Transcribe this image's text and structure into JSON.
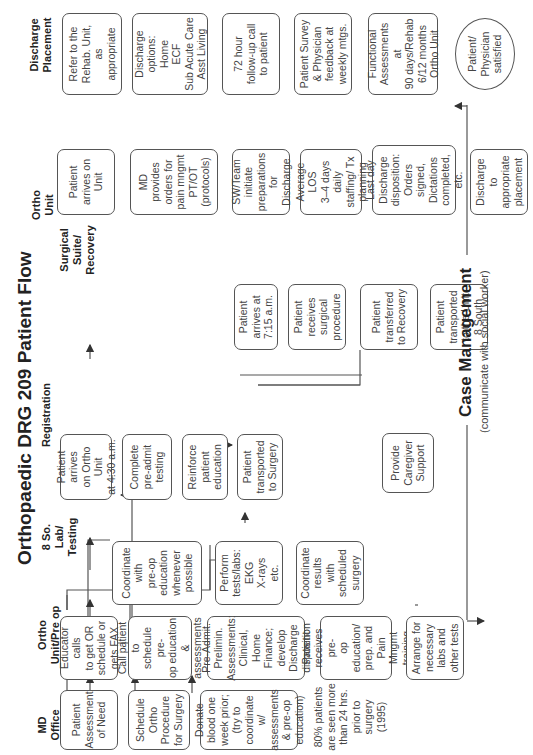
{
  "title": "Orthopaedic DRG 209  Patient Flow",
  "columns": [
    {
      "id": "md-office",
      "label": "MD\nOffice"
    },
    {
      "id": "ortho-preop",
      "label": "Ortho\nUnit/Pre op"
    },
    {
      "id": "lab-testing",
      "label": "8 So.\nLab/\nTesting"
    },
    {
      "id": "registration",
      "label": "Registration"
    },
    {
      "id": "surgical",
      "label": "Surgical\nSuite/\nRecovery"
    },
    {
      "id": "ortho-unit",
      "label": "Ortho\nUnit"
    },
    {
      "id": "discharge",
      "label": "Discharge\nPlacement"
    }
  ],
  "boxes": {
    "md_assessment": "Patient\nAssessment\nof Need",
    "md_schedule": "Schedule\nOrtho\nProcedure\nfor Surgery",
    "md_donate": "Donate\nblood one\nweek prior;\n(try to\ncoordinate w/\nassessments\n& pre-op\neducation)",
    "md_note": "80% patients\nare seen more\nthan 24 hrs.\nprior to\nsurgery\n(1995)",
    "pre_educator": "Educator calls\nto get OR\nschedule or\ngets FAX",
    "pre_call": "Call patient to\nschedule pre-\nop education\n&\nassessments",
    "pre_admit": "Pre-Admit.\nPrelimin.\nAssessments:\nClinical, Home\nFinance;\ndevelop\nDischarge\ndisposition",
    "pre_receives": "Patient\nreceives pre-\nop education/\nprep. and\nPain Mngmt\ntraining",
    "pre_arrange": "Arrange for\nnecessary\nlabs and\nother tests",
    "lab_coordinate": "Coordinate\nwith\npre-op\neducation\nwhenever\npossible",
    "lab_perform": "Perform\ntests/labs:\nEKG\nX-rays\netc.",
    "lab_results": "Coordinate\nresults\nwith\nscheduled\nsurgery",
    "reg_arrives": "Patient arrives\non Ortho Unit\nat 4:30 a.m.",
    "reg_complete": "Complete\npre-admit\ntesting",
    "reg_reinforce": "Reinforce\npatient\neducation",
    "reg_transported": "Patient\ntransported\nto Surgery",
    "reg_caregiver": "Provide\nCaregiver\nSupport",
    "surg_arrives": "Patient\narrives at\n7:15 a.m.",
    "surg_receives": "Patient\nreceives\nsurgical\nprocedure",
    "surg_recovery": "Patient\ntransferred\nto Recovery",
    "surg_unit": "Patient\ntransported\nto the Unit\n8 South",
    "ou_arrives": "Patient\narrives on\nUnit",
    "ou_md": "MD\nprovides\norders for\npain mngmt\nPT/OT\n(protocols)",
    "ou_sw": "SW/Team\ninitiate\npreparations\nfor Discharge",
    "ou_los": "Average LOS\n3–4 days daily\nstaffing/ Tx\nplanning",
    "ou_lastday": "Last day\nDischarge\ndisposition:\nOrders signed,\nDictations\ncompleted, etc.",
    "ou_discharge": "Discharge to\nappropriate\nplacement",
    "dp_rehab": "Refer to the\nRehab. Unit,\nas\nappropriate",
    "dp_options": "Discharge\noptions:\nHome\nECF\nSub Acute Care\nAsst Living",
    "dp_followup": "72 hour\nfollow-up call\nto patient",
    "dp_survey": "Patient Survey\n& Physician\nfeedback at\nweekly mtgs.",
    "dp_functional": "Functional\nAssessments at\n90 days/Rehab\n6/12 months\nOrtho Unit",
    "dp_satisfied": "Patient/\nPhysician\nsatisfied"
  },
  "case_management": {
    "title": "Case Management",
    "subtitle": "(communicate with social worker)"
  },
  "colors": {
    "line": "#555555",
    "caregiver_link": "#5566cc"
  }
}
